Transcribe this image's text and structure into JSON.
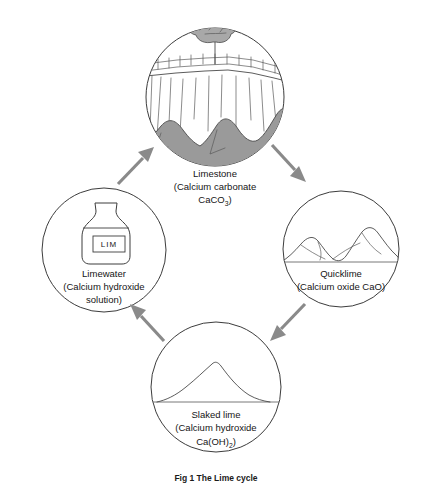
{
  "figure": {
    "caption": "Fig 1 The Lime cycle",
    "background_color": "#ffffff",
    "stroke_color": "#3c3c3c",
    "arrow_color": "#8a8a8a",
    "rubble_color": "#9a9a9a"
  },
  "nodes": {
    "limestone": {
      "name": "Limestone",
      "line1": "Limestone",
      "line2": "(Calcium carbonate",
      "formula_main": "CaCO",
      "formula_sub": "3",
      "formula_tail": ")",
      "illustration": "limestone-quarry-illustration"
    },
    "quicklime": {
      "name": "Quicklime",
      "line1": "Quicklime",
      "line2": "(Calcium oxide CaO)",
      "illustration": "quicklime-lumps-illustration"
    },
    "slaked_lime": {
      "name": "Slaked lime",
      "line1": "Slaked lime",
      "line2": "(Calcium hydroxide",
      "formula_main": "Ca(OH)",
      "formula_sub": "2",
      "formula_tail": ")",
      "illustration": "slaked-lime-powder-illustration"
    },
    "limewater": {
      "name": "Limewater",
      "line1": "Limewater",
      "line2": "(Calcium hydroxide",
      "line3": "solution)",
      "bottle_label": "LIM",
      "illustration": "limewater-bottle-illustration"
    }
  },
  "arrows": [
    {
      "id": "arrow-limewater-to-limestone",
      "from": "limewater",
      "to": "limestone",
      "direction": "up-right"
    },
    {
      "id": "arrow-limestone-to-quicklime",
      "from": "limestone",
      "to": "quicklime",
      "direction": "down-right"
    },
    {
      "id": "arrow-quicklime-to-slaked-lime",
      "from": "quicklime",
      "to": "slaked_lime",
      "direction": "down-left"
    },
    {
      "id": "arrow-slaked-lime-to-limewater",
      "from": "slaked_lime",
      "to": "limewater",
      "direction": "up-left"
    }
  ]
}
